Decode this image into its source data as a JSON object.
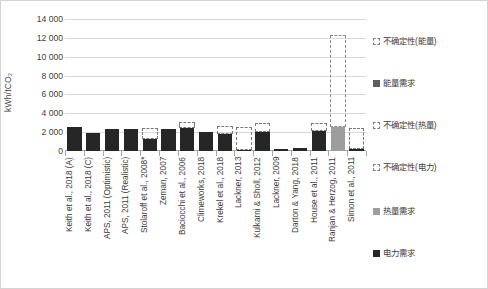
{
  "chart_data": {
    "type": "bar",
    "title": "",
    "subtitle": "",
    "xlabel": "",
    "ylabel": "kWh/tCO₂",
    "ylim": [
      0,
      14000
    ],
    "ytick_values": [
      0,
      2000,
      4000,
      6000,
      8000,
      10000,
      12000,
      14000
    ],
    "ytick_labels": [
      "0",
      "2 000",
      "4 000",
      "6 000",
      "8 000",
      "10 000",
      "12 000",
      "14 000"
    ],
    "grid": true,
    "legend_position": "right",
    "categories": [
      "Keith et al., 2018 (A)",
      "Keith et al., 2018 (C)",
      "APS, 2011 (Optimistic)",
      "APS, 2011 (Realistic)",
      "Stolaroff et al., 2008*",
      "Zeman, 2007",
      "Baciocchi et al., 2006",
      "Climeworks, 2018",
      "Krekel et al., 2018",
      "Lackner, 2013",
      "Kulkarni & Sholl, 2012",
      "Lackner, 2009",
      "Darton & Yang, 2018",
      "House et al., 2011",
      "Ranjan & Herzog, 2011",
      "Simon et al., 2011"
    ],
    "series": [
      {
        "name": "电力需求",
        "key": "electricity",
        "color": "#262626",
        "values": [
          2550,
          1950,
          2300,
          2300,
          1300,
          2350,
          2450,
          2000,
          1800,
          130,
          2000,
          180,
          330,
          2100,
          0,
          170
        ]
      },
      {
        "name": "热量需求",
        "key": "heat",
        "color": "#9d9d9d",
        "values": [
          0,
          0,
          0,
          0,
          0,
          0,
          0,
          0,
          0,
          0,
          0,
          0,
          0,
          0,
          2500,
          0
        ]
      },
      {
        "name": "能量需求",
        "key": "energy",
        "color": "#5e5e5e",
        "values": [
          0,
          0,
          0,
          0,
          0,
          0,
          0,
          0,
          0,
          0,
          0,
          0,
          0,
          0,
          0,
          0
        ]
      }
    ],
    "uncertainty": [
      {
        "category_index": 4,
        "kind": "不确定性(电力)",
        "low": 1300,
        "high": 2450
      },
      {
        "category_index": 6,
        "kind": "不确定性(电力)",
        "low": 2450,
        "high": 3050
      },
      {
        "category_index": 8,
        "kind": "不确定性(电力)",
        "low": 1800,
        "high": 2700
      },
      {
        "category_index": 9,
        "kind": "不确定性(电力)",
        "low": 130,
        "high": 2500
      },
      {
        "category_index": 10,
        "kind": "不确定性(电力)",
        "low": 2000,
        "high": 2950
      },
      {
        "category_index": 13,
        "kind": "不确定性(电力)",
        "low": 2100,
        "high": 3000
      },
      {
        "category_index": 14,
        "kind": "不确定性(能量)",
        "low": 2500,
        "high": 12300
      },
      {
        "category_index": 15,
        "kind": "不确定性(电力)",
        "low": 170,
        "high": 2450
      }
    ],
    "legend_entries": [
      {
        "label": "不确定性(能量)",
        "style": "dashed",
        "color": "#7a7a7a"
      },
      {
        "label": "能量需求",
        "style": "solid",
        "color": "#5e5e5e"
      },
      {
        "label": "不确定性(热量)",
        "style": "dashed",
        "color": "#7a7a7a"
      },
      {
        "label": "不确定性(电力)",
        "style": "dashed",
        "color": "#7a7a7a"
      },
      {
        "label": "热量需求",
        "style": "solid",
        "color": "#9d9d9d"
      },
      {
        "label": "电力需求",
        "style": "solid",
        "color": "#262626"
      }
    ]
  }
}
